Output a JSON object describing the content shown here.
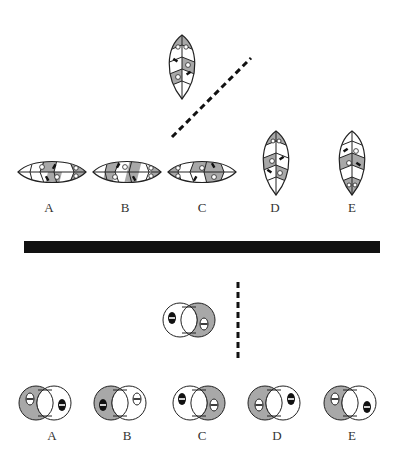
{
  "colors": {
    "gray_fill": "#a8a8a8",
    "stroke": "#222222",
    "divider": "#111111",
    "background": "#ffffff"
  },
  "top_puzzle": {
    "question_figure": {
      "type": "leaf",
      "orientation": "vertical",
      "center": [
        182,
        67
      ]
    },
    "mirror_line": {
      "style": "dashed",
      "from": [
        172,
        137
      ],
      "to": [
        251,
        58
      ]
    },
    "options": [
      {
        "label": "A",
        "orientation": "horizontal",
        "center": [
          52,
          172
        ],
        "label_pos": [
          49,
          207
        ]
      },
      {
        "label": "B",
        "orientation": "horizontal",
        "center": [
          127,
          172
        ],
        "label_pos": [
          125,
          207
        ]
      },
      {
        "label": "C",
        "orientation": "horizontal",
        "center": [
          202,
          172
        ],
        "label_pos": [
          202,
          207
        ]
      },
      {
        "label": "D",
        "orientation": "vertical",
        "center": [
          276,
          163
        ],
        "label_pos": [
          275,
          207
        ]
      },
      {
        "label": "E",
        "orientation": "vertical",
        "center": [
          352,
          163
        ],
        "label_pos": [
          352,
          207
        ]
      }
    ]
  },
  "divider": {
    "x": 24,
    "y": 241,
    "width": 356,
    "height": 12
  },
  "bottom_puzzle": {
    "question_figure": {
      "center": [
        189,
        320
      ],
      "left_gray": false,
      "right_gray": true,
      "left_oval": "black",
      "right_oval": "white"
    },
    "mirror_line": {
      "style": "dashed",
      "from": [
        238,
        282
      ],
      "to": [
        238,
        362
      ]
    },
    "options": [
      {
        "label": "A",
        "center": [
          45,
          403
        ],
        "left_gray": true,
        "right_gray": false,
        "left_oval": "white",
        "right_oval": "black",
        "label_pos": [
          52,
          435
        ]
      },
      {
        "label": "B",
        "center": [
          120,
          403
        ],
        "left_gray": true,
        "right_gray": false,
        "left_oval": "black",
        "right_oval": "white",
        "label_pos": [
          127,
          435
        ]
      },
      {
        "label": "C",
        "center": [
          199,
          403
        ],
        "left_gray": false,
        "right_gray": true,
        "left_oval": "black",
        "right_oval": "white",
        "label_pos": [
          202,
          435
        ]
      },
      {
        "label": "D",
        "center": [
          274,
          403
        ],
        "left_gray": true,
        "right_gray": false,
        "left_oval": "white",
        "right_oval": "black",
        "label_pos": [
          277,
          435
        ]
      },
      {
        "label": "E",
        "center": [
          350,
          403
        ],
        "left_gray": true,
        "right_gray": false,
        "left_oval": "white",
        "right_oval": "black",
        "label_pos": [
          352,
          435
        ]
      }
    ]
  }
}
